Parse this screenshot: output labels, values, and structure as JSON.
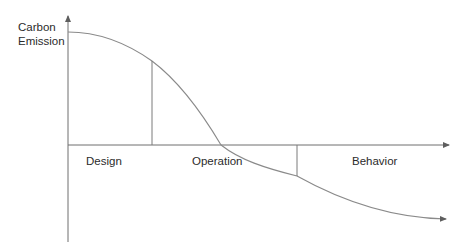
{
  "diagram": {
    "y_axis_label_line1": "Carbon",
    "y_axis_label_line2": "Emission",
    "phases": [
      {
        "label": "Design"
      },
      {
        "label": "Operation"
      },
      {
        "label": "Behavior"
      }
    ],
    "colors": {
      "axis": "#6e6e6e",
      "curve": "#8a8a8a",
      "divider": "#7a7a7a",
      "text": "#2b2b2b"
    }
  }
}
